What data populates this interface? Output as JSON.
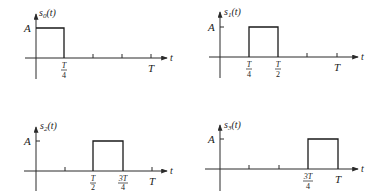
{
  "diagram": {
    "amplitude_label": "A",
    "time_axis_label": "t",
    "period_label": "T",
    "panels": [
      {
        "name": "s0",
        "title_base": "s",
        "title_sub": "0",
        "title_arg": "(t)",
        "pulse_start": "0",
        "pulse_end": "T/4",
        "tick_labels": [
          {
            "num": "T",
            "den": "4"
          }
        ],
        "end_label": "T"
      },
      {
        "name": "s1",
        "title_base": "s",
        "title_sub": "1",
        "title_arg": "(t)",
        "pulse_start": "T/4",
        "pulse_end": "T/2",
        "tick_labels": [
          {
            "num": "T",
            "den": "4"
          },
          {
            "num": "T",
            "den": "2"
          }
        ],
        "end_label": "T"
      },
      {
        "name": "s2",
        "title_base": "s",
        "title_sub": "2",
        "title_arg": "(t)",
        "pulse_start": "T/2",
        "pulse_end": "3T/4",
        "tick_labels": [
          {
            "num": "T",
            "den": "2"
          },
          {
            "num": "3T",
            "den": "4"
          }
        ],
        "end_label": "T"
      },
      {
        "name": "s3",
        "title_base": "s",
        "title_sub": "3",
        "title_arg": "(t)",
        "pulse_start": "3T/4",
        "pulse_end": "T",
        "tick_labels": [
          {
            "num": "3T",
            "den": "4"
          }
        ],
        "end_label": "T"
      }
    ]
  }
}
